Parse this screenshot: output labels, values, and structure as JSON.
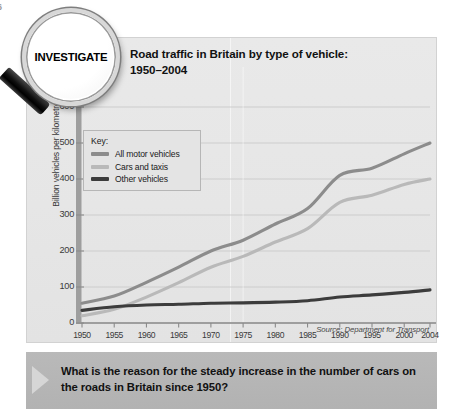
{
  "page_number": "6",
  "badge": {
    "label": "INVESTIGATE",
    "icon": "magnifier-icon"
  },
  "header": {
    "title": "Road traffic in Britain by type of vehicle:",
    "subtitle": "1950–2004"
  },
  "legend": {
    "title": "Key:",
    "items": [
      {
        "label": "All motor vehicles",
        "color": "#8c8c8c"
      },
      {
        "label": "Cars and taxis",
        "color": "#b9b9b9"
      },
      {
        "label": "Other vehicles",
        "color": "#3c3c3c"
      }
    ]
  },
  "source": "Source: Department for Transport",
  "question": "What is the reason for the steady increase in the number of cars on the roads in Britain since 1950?",
  "chart_data": {
    "type": "line",
    "title": "Road traffic in Britain by type of vehicle: 1950–2004",
    "xlabel": "",
    "ylabel": "Billion vehicles per kilometre",
    "xlim": [
      1950,
      2004
    ],
    "ylim": [
      0,
      600
    ],
    "yticks": [
      0,
      100,
      200,
      300,
      400,
      500,
      600
    ],
    "xticks": [
      1950,
      1955,
      1960,
      1965,
      1970,
      1975,
      1980,
      1985,
      1990,
      1995,
      2000,
      2004
    ],
    "grid": true,
    "legend_position": "upper-left-inside",
    "x": [
      1950,
      1955,
      1960,
      1965,
      1970,
      1975,
      1980,
      1985,
      1990,
      1995,
      2000,
      2004
    ],
    "series": [
      {
        "name": "All motor vehicles",
        "color": "#8c8c8c",
        "values": [
          55,
          75,
          113,
          155,
          200,
          230,
          275,
          318,
          410,
          430,
          470,
          500
        ]
      },
      {
        "name": "Cars and taxis",
        "color": "#b9b9b9",
        "values": [
          20,
          38,
          72,
          112,
          155,
          185,
          225,
          262,
          335,
          355,
          385,
          400
        ]
      },
      {
        "name": "Other vehicles",
        "color": "#3c3c3c",
        "values": [
          35,
          45,
          50,
          52,
          55,
          56,
          58,
          62,
          72,
          78,
          85,
          92
        ]
      }
    ]
  }
}
